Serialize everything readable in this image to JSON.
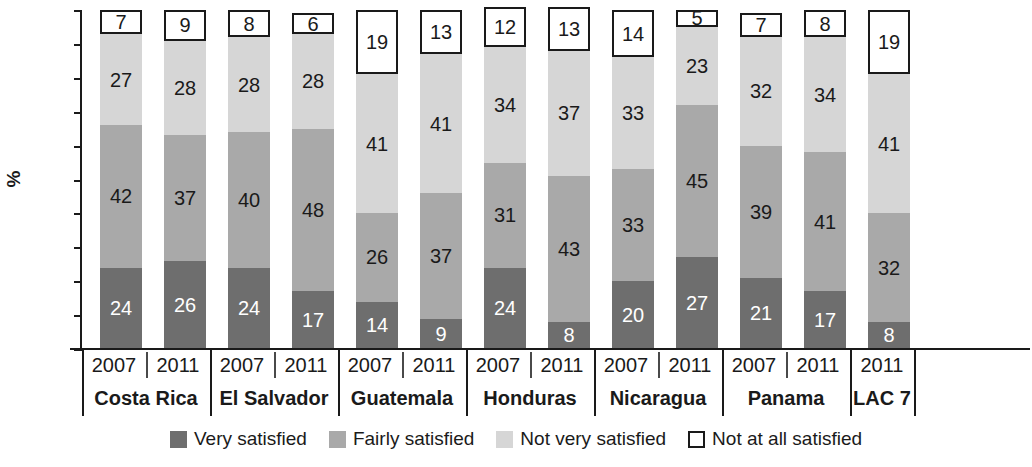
{
  "chart_data": {
    "type": "bar",
    "subtype": "stacked-bar-100",
    "title": "",
    "xlabel": "",
    "ylabel": "%",
    "ylim": [
      0,
      100
    ],
    "ytick_step": 10,
    "yticks": [
      100,
      90,
      80,
      70,
      60,
      50,
      40,
      30,
      20,
      10,
      0
    ],
    "grid": false,
    "legend_position": "bottom",
    "categories": [
      "Costa Rica 2007",
      "Costa Rica 2011",
      "El Salvador 2007",
      "El Salvador 2011",
      "Guatemala 2007",
      "Guatemala 2011",
      "Honduras 2007",
      "Honduras 2011",
      "Nicaragua 2007",
      "Nicaragua 2011",
      "Panama 2007",
      "Panama 2011",
      "LAC 7 2011"
    ],
    "series": [
      {
        "name": "Very satisfied",
        "color": "#6e6e6e",
        "values": [
          24,
          26,
          24,
          17,
          14,
          9,
          24,
          8,
          20,
          27,
          21,
          17,
          8
        ]
      },
      {
        "name": "Fairly satisfied",
        "color": "#a9a9a9",
        "values": [
          42,
          37,
          40,
          48,
          26,
          37,
          31,
          43,
          33,
          45,
          39,
          41,
          32
        ]
      },
      {
        "name": "Not very satisfied",
        "color": "#d6d6d6",
        "values": [
          27,
          28,
          28,
          28,
          41,
          41,
          34,
          37,
          33,
          23,
          32,
          34,
          41
        ]
      },
      {
        "name": "Not at all satisfied",
        "color": "#ffffff",
        "values": [
          7,
          9,
          8,
          6,
          19,
          13,
          12,
          13,
          14,
          5,
          7,
          8,
          19
        ]
      }
    ],
    "groups": [
      {
        "country": "Costa Rica",
        "years": [
          "2007",
          "2011"
        ]
      },
      {
        "country": "El Salvador",
        "years": [
          "2007",
          "2011"
        ]
      },
      {
        "country": "Guatemala",
        "years": [
          "2007",
          "2011"
        ]
      },
      {
        "country": "Honduras",
        "years": [
          "2007",
          "2011"
        ]
      },
      {
        "country": "Nicaragua",
        "years": [
          "2007",
          "2011"
        ]
      },
      {
        "country": "Panama",
        "years": [
          "2007",
          "2011"
        ]
      },
      {
        "country": "LAC 7",
        "years": [
          "2011"
        ]
      }
    ]
  },
  "legend": {
    "items": [
      {
        "label": "Very satisfied",
        "swatch": "sw-very"
      },
      {
        "label": "Fairly satisfied",
        "swatch": "sw-fairly"
      },
      {
        "label": "Not very satisfied",
        "swatch": "sw-notvery"
      },
      {
        "label": "Not at all satisfied",
        "swatch": "sw-notatall"
      }
    ]
  }
}
